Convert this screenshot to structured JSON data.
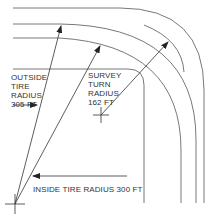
{
  "diagram": {
    "labels": {
      "outside": [
        "OUTSIDE",
        "TIRE",
        "RADIUS",
        "305 FT"
      ],
      "survey": [
        "SURVEY",
        "TURN",
        "RADIUS",
        "162 FT"
      ],
      "inside": "INSIDE TIRE RADIUS 300 FT"
    },
    "colors": {
      "line": "#555555",
      "text": "#333333",
      "background": "#ffffff"
    }
  }
}
